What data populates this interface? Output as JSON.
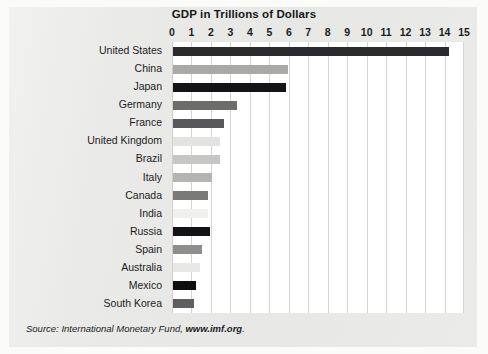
{
  "chart_data": {
    "type": "bar",
    "orientation": "horizontal",
    "title": "GDP in Trillions of Dollars",
    "xlabel": "",
    "ylabel": "",
    "xlim": [
      0,
      15
    ],
    "xticks": [
      0,
      1,
      2,
      3,
      4,
      5,
      6,
      7,
      8,
      9,
      10,
      11,
      12,
      13,
      14,
      15
    ],
    "grid": true,
    "legend": "none",
    "categories": [
      "United States",
      "China",
      "Japan",
      "Germany",
      "France",
      "United Kingdom",
      "Brazil",
      "Italy",
      "Canada",
      "India",
      "Russia",
      "Spain",
      "Australia",
      "Mexico",
      "South Korea"
    ],
    "values": [
      14.2,
      5.9,
      5.8,
      3.3,
      2.6,
      2.4,
      2.4,
      2.0,
      1.8,
      1.8,
      1.9,
      1.5,
      1.4,
      1.2,
      1.1
    ],
    "bar_colors": [
      "#2b2b2d",
      "#a9a9a7",
      "#141416",
      "#6c6c6a",
      "#58585a",
      "#e3e3e1",
      "#c6c6c4",
      "#b4b4b2",
      "#7a7a78",
      "#f0f0ee",
      "#121214",
      "#8e8e8c",
      "#e8e8e6",
      "#0f0f11",
      "#5f5f61"
    ]
  },
  "source": {
    "prefix": "Source: International Monetary Fund, ",
    "site": "www.imf.org",
    "suffix": "."
  },
  "colors": {
    "page_background": "#e9e9e7",
    "plot_background": "#ffffff",
    "gridline": "#d5d5d3",
    "text": "#1b1b1e"
  }
}
